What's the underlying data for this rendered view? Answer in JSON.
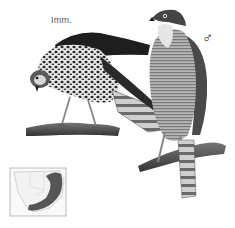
{
  "plate": {
    "type": "field-guide illustration",
    "labels": {
      "immature": "Imm.",
      "male_symbol": "♂"
    },
    "figures": [
      {
        "name": "immature-bird",
        "pose": "leaning forward on branch",
        "plumage": "dark brown back, heavily spotted breast, barred tail"
      },
      {
        "name": "adult-male-bird",
        "pose": "upright on branch",
        "plumage": "dark grey cap and back, finely barred underparts, banded tail"
      }
    ],
    "map": {
      "name": "distribution-map",
      "region": "southern Africa",
      "shading_color": "#555555"
    },
    "colors": {
      "background": "#ffffff",
      "ink_dark": "#222222",
      "ink_mid": "#777777",
      "ink_light": "#bbbbbb"
    }
  }
}
